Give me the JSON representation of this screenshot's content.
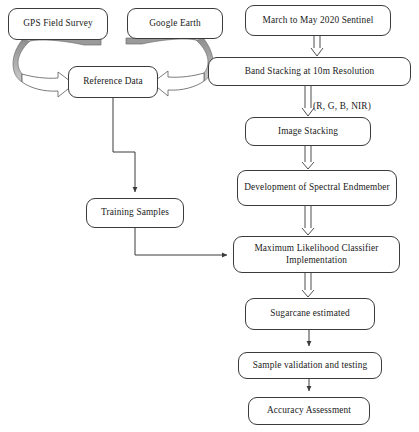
{
  "diagram": {
    "type": "flowchart",
    "nodes": [
      {
        "id": "gps",
        "label": "GPS Field Survey"
      },
      {
        "id": "ge",
        "label": "Google Earth"
      },
      {
        "id": "sentinel",
        "label": "March to May 2020 Sentinel"
      },
      {
        "id": "refdata",
        "label": "Reference Data"
      },
      {
        "id": "band",
        "label": "Band Stacking at 10m Resolution"
      },
      {
        "id": "imgstack",
        "label": "Image Stacking"
      },
      {
        "id": "endmember",
        "label": "Development of Spectral Endmember"
      },
      {
        "id": "training",
        "label": "Training Samples"
      },
      {
        "id": "mlc",
        "label": "Maximum Likelihood Classifier Implementation"
      },
      {
        "id": "sugarcane",
        "label": "Sugarcane estimated"
      },
      {
        "id": "validate",
        "label": "Sample validation and testing"
      },
      {
        "id": "accuracy",
        "label": "Accuracy Assessment"
      }
    ],
    "edge_labels": [
      {
        "id": "rgbnir",
        "label": "(R, G, B, NIR)"
      }
    ],
    "edges": [
      {
        "from": "gps",
        "to": "refdata",
        "style": "curved-block-arrow"
      },
      {
        "from": "ge",
        "to": "refdata",
        "style": "curved-block-arrow"
      },
      {
        "from": "refdata",
        "to": "training",
        "style": "elbow-line-arrow"
      },
      {
        "from": "training",
        "to": "mlc",
        "style": "elbow-line-arrow"
      },
      {
        "from": "sentinel",
        "to": "band",
        "style": "double-line-arrow"
      },
      {
        "from": "band",
        "to": "imgstack",
        "style": "double-line-arrow",
        "label": "(R, G, B, NIR)"
      },
      {
        "from": "imgstack",
        "to": "endmember",
        "style": "double-line-arrow"
      },
      {
        "from": "endmember",
        "to": "mlc",
        "style": "double-line-arrow"
      },
      {
        "from": "mlc",
        "to": "sugarcane",
        "style": "double-line-arrow"
      },
      {
        "from": "sugarcane",
        "to": "validate",
        "style": "line-arrow"
      },
      {
        "from": "validate",
        "to": "accuracy",
        "style": "line-arrow"
      }
    ],
    "colors": {
      "stroke": "#3b3b3b",
      "text": "#1a1a1a",
      "background": "#ffffff",
      "curved_arrow_shade": "#9a9a9a"
    }
  }
}
